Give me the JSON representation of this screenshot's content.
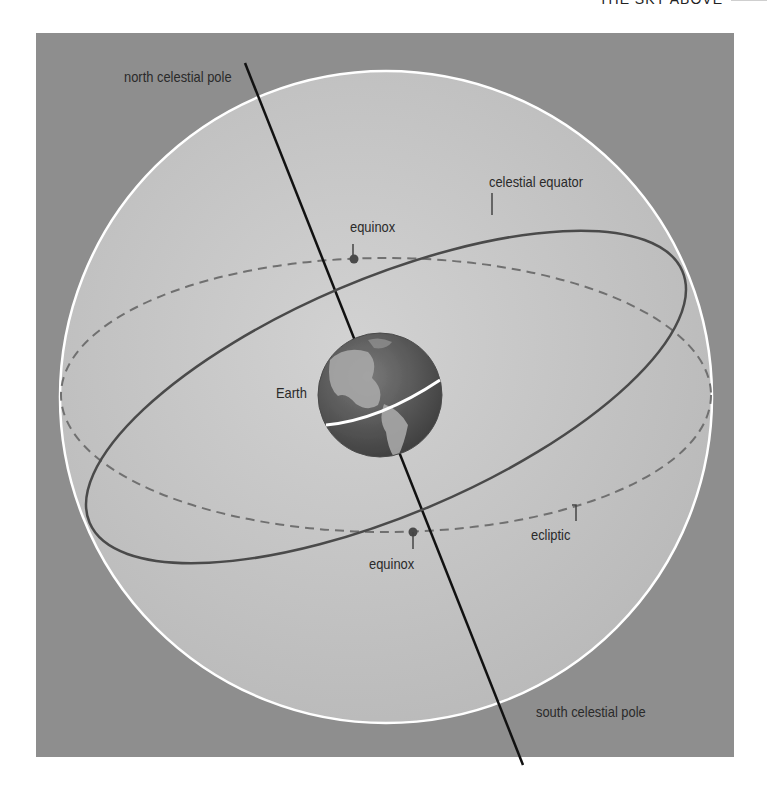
{
  "header": {
    "title": "THE SKY ABOVE"
  },
  "diagram": {
    "labels": {
      "north_pole": "north celestial pole",
      "south_pole": "south celestial pole",
      "celestial_equator": "celestial equator",
      "equinox_top": "equinox",
      "equinox_bottom": "equinox",
      "earth": "Earth",
      "ecliptic": "ecliptic"
    },
    "colors": {
      "background_panel": "#8e8e8e",
      "sphere_fill": "#c4c4c4",
      "sphere_outline": "#ffffff",
      "axis": "#111111",
      "equator": "#4a4a4a",
      "ecliptic": "#6a6a6a",
      "earth_ocean": "#5a5a5a",
      "earth_land": "#9a9a9a"
    },
    "icons": {
      "equinox_marker": "dot-marker-icon",
      "earth": "globe-icon"
    }
  }
}
